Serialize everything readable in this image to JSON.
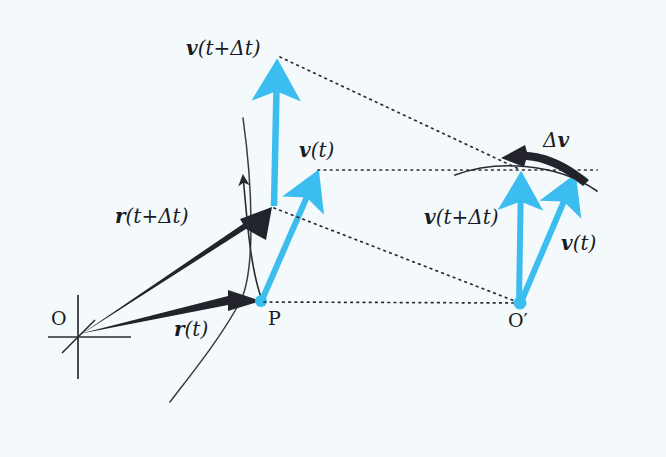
{
  "figure": {
    "background_color": "#f4fafb",
    "vector_color": "#3bbdf0",
    "ink_color": "#1a1a22",
    "width": 666,
    "height": 457
  },
  "labels": {
    "origin": "O",
    "origin_prime": "O′",
    "point_p": "P",
    "r_t": {
      "bold": "r",
      "rest": "(t)"
    },
    "r_t_dt": {
      "bold": "r",
      "rest": "(t+Δt)"
    },
    "v_t_left": {
      "bold": "v",
      "rest": "(t)"
    },
    "v_t_dt_left": {
      "bold": "v",
      "rest": "(t+Δt)"
    },
    "v_t_right": {
      "bold": "v",
      "rest": "(t)"
    },
    "v_t_dt_right": {
      "bold": "v",
      "rest": "(t+Δt)"
    },
    "delta_v": {
      "delta": "Δ",
      "bold": "v"
    }
  },
  "geometry": {
    "origin_point": [
      78,
      336
    ],
    "point_p": [
      261,
      301
    ],
    "point_q": [
      272,
      207
    ],
    "origin_prime": [
      520,
      303
    ],
    "v_t_left_tip": [
      318,
      170
    ],
    "v_t_dt_left_tip": [
      277,
      58
    ],
    "v_t_right_tip": [
      575,
      172
    ],
    "v_t_dt_right_tip": [
      521,
      170
    ],
    "trajectory_start": [
      170,
      402
    ],
    "trajectory_end": [
      243,
      118
    ],
    "delta_v_arc_start": [
      455,
      174
    ],
    "delta_v_arc_end": [
      597,
      190
    ]
  },
  "elements": {
    "trajectory_curve": "path-curve",
    "delta_v_arc": "delta-v-arc",
    "dotted_connectors": 4
  }
}
